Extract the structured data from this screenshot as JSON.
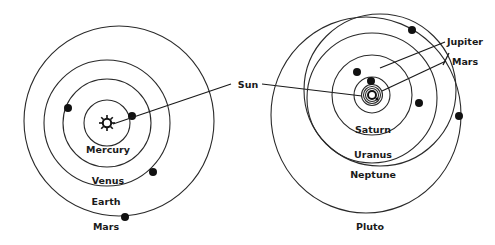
{
  "diagram": {
    "colors": {
      "line": "#2a2a2a",
      "planet": "#111111",
      "background": "#ffffff"
    },
    "inner_system": {
      "labels": {
        "mercury": "Mercury",
        "venus": "Venus",
        "earth": "Earth",
        "mars": "Mars"
      },
      "sun_icon": "sun-icon"
    },
    "shared": {
      "sun_label": "Sun"
    },
    "outer_system": {
      "labels": {
        "jupiter": "Jupiter",
        "mars": "Mars",
        "saturn": "Saturn",
        "uranus": "Uranus",
        "neptune": "Neptune",
        "pluto": "Pluto"
      }
    }
  }
}
